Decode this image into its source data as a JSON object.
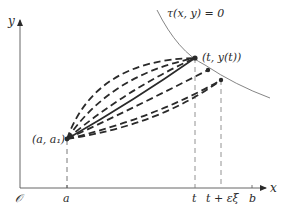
{
  "diagram": {
    "axes": {
      "x_label": "x",
      "y_label": "y",
      "origin_label": "𝒪"
    },
    "tick_labels": {
      "a": "a",
      "t": "t",
      "t_eps": "t + εξ",
      "b": "b"
    },
    "curve_label": "τ(x, y) = 0",
    "points": {
      "start": "(a, a₁)",
      "end": "(t, y(t))"
    },
    "colors": {
      "ink": "#2a2a2a",
      "axis": "#555555",
      "curve": "#777777"
    }
  }
}
